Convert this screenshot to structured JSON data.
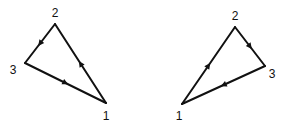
{
  "diagrams": [
    {
      "name": "left-triangle",
      "orientation": "clockwise",
      "vertices": [
        {
          "label": "1",
          "x": 106,
          "y": 103,
          "lx": 106,
          "ly": 120
        },
        {
          "label": "2",
          "x": 55,
          "y": 24,
          "lx": 55,
          "ly": 17
        },
        {
          "label": "3",
          "x": 25,
          "y": 63,
          "lx": 13,
          "ly": 74
        }
      ],
      "edges": [
        [
          "1",
          "2"
        ],
        [
          "2",
          "3"
        ],
        [
          "3",
          "1"
        ]
      ]
    },
    {
      "name": "right-triangle",
      "orientation": "counterclockwise",
      "vertices": [
        {
          "label": "1",
          "x": 182,
          "y": 104,
          "lx": 179,
          "ly": 120
        },
        {
          "label": "2",
          "x": 235,
          "y": 27,
          "lx": 235,
          "ly": 20
        },
        {
          "label": "3",
          "x": 265,
          "y": 66,
          "lx": 272,
          "ly": 78
        }
      ],
      "edges": [
        [
          "1",
          "2"
        ],
        [
          "2",
          "3"
        ],
        [
          "3",
          "1"
        ]
      ]
    }
  ],
  "colors": {
    "stroke": "#111111",
    "background": "#ffffff"
  }
}
